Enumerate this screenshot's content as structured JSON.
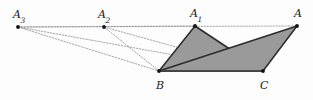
{
  "figure": {
    "background_color": "#fdfdfd",
    "width": 313,
    "height": 100,
    "colors": {
      "triangle_fill": "#9a9a9a",
      "triangle_stroke": "#2b2b2b",
      "solid_line": "#4a4a4a",
      "dotted_line": "#8e8e8e",
      "point": "#111111",
      "label_text": "#1a1a1a"
    },
    "points": [
      {
        "id": "A3",
        "label": "A",
        "subscript": "3",
        "x": 18,
        "y": 27,
        "label_x": 13,
        "label_y": 9
      },
      {
        "id": "A2",
        "label": "A",
        "subscript": "2",
        "x": 104,
        "y": 27,
        "label_x": 98,
        "label_y": 9
      },
      {
        "id": "A1",
        "label": "A",
        "subscript": "1",
        "x": 195,
        "y": 26,
        "label_x": 190,
        "label_y": 8
      },
      {
        "id": "A",
        "label": "A",
        "subscript": "",
        "x": 297,
        "y": 26,
        "label_x": 294,
        "label_y": 8
      },
      {
        "id": "B",
        "label": "B",
        "subscript": "",
        "x": 159,
        "y": 71,
        "label_x": 156,
        "label_y": 80
      },
      {
        "id": "C",
        "label": "C",
        "subscript": "",
        "x": 263,
        "y": 71,
        "label_x": 260,
        "label_y": 80
      }
    ],
    "shaded_triangles": [
      {
        "id": "triangle-A1BC",
        "vertices": [
          "A1",
          "B",
          "C"
        ],
        "fill": "#9a9a9a",
        "stroke": "#2b2b2b"
      },
      {
        "id": "triangle-ABC",
        "vertices": [
          "A",
          "B",
          "C"
        ],
        "fill": "#9a9a9a",
        "stroke": "#2b2b2b"
      }
    ],
    "solid_edges": [
      {
        "id": "edge-BC",
        "from": "B",
        "to": "C",
        "color": "#4a4a4a",
        "width": 1.6
      }
    ],
    "dotted_lines": [
      {
        "id": "line-apex-axis",
        "from": "A3",
        "to": "A",
        "color": "#8e8e8e"
      },
      {
        "id": "line-A3-B",
        "from": "A3",
        "to": "B",
        "color": "#8e8e8e"
      },
      {
        "id": "line-A3-C",
        "from": "A3",
        "to": "C",
        "color": "#8e8e8e"
      },
      {
        "id": "line-A2-B",
        "from": "A2",
        "to": "B",
        "color": "#8e8e8e"
      },
      {
        "id": "line-A2-C",
        "from": "A2",
        "to": "C",
        "color": "#8e8e8e"
      },
      {
        "id": "line-A1-B-dash",
        "from": "A1",
        "to": "B",
        "color": "#8e8e8e"
      },
      {
        "id": "line-A3-A1",
        "from": "A3",
        "to": "A1",
        "color": "#8e8e8e"
      }
    ]
  }
}
